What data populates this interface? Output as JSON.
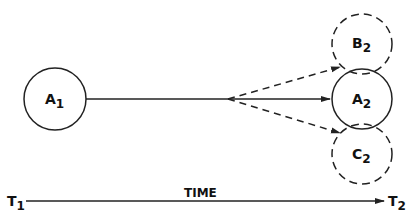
{
  "nodes": [
    {
      "id": "A1",
      "label": "A",
      "sub": "1",
      "style": "solid"
    },
    {
      "id": "A2",
      "label": "A",
      "sub": "2",
      "style": "solid"
    },
    {
      "id": "B2",
      "label": "B",
      "sub": "2",
      "style": "dashed"
    },
    {
      "id": "C2",
      "label": "C",
      "sub": "2",
      "style": "dashed"
    }
  ],
  "axis": {
    "start_label": "T",
    "start_sub": "1",
    "end_label": "T",
    "end_sub": "2",
    "title": "TIME"
  },
  "colors": {
    "stroke": "#222222",
    "background": "#ffffff"
  }
}
